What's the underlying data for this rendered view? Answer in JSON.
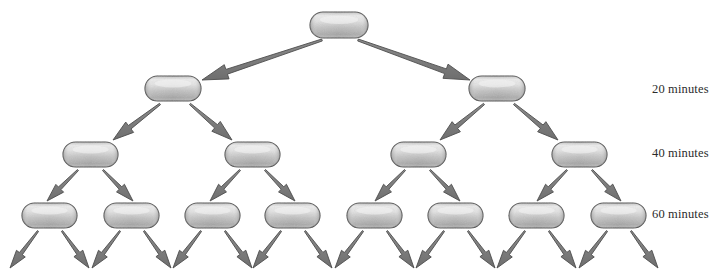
{
  "diagram": {
    "background_color": "#ffffff",
    "cell": {
      "name": "bacterium-capsule",
      "fill_light": "#e2e2e2",
      "fill_mid": "#bdbdbd",
      "fill_dark": "#9a9a9a",
      "outline_color": "#4a4a4a"
    },
    "arrow": {
      "name": "division-arrow",
      "fill_color": "#808080",
      "outline_color": "#4d4d4d"
    },
    "rows": [
      {
        "index": 0,
        "label": "",
        "cell_count": 1,
        "cells": [
          {
            "name": "cell-r0-c0",
            "x": 310,
            "y": 12,
            "w": 58,
            "h": 26
          }
        ]
      },
      {
        "index": 1,
        "label": "20 minutes",
        "cell_count": 2,
        "cells": [
          {
            "name": "cell-r1-c0",
            "x": 145,
            "y": 76,
            "w": 56,
            "h": 25
          },
          {
            "name": "cell-r1-c1",
            "x": 469,
            "y": 76,
            "w": 56,
            "h": 25
          }
        ]
      },
      {
        "index": 2,
        "label": "40 minutes",
        "cell_count": 4,
        "cells": [
          {
            "name": "cell-r2-c0",
            "x": 63,
            "y": 142,
            "w": 55,
            "h": 25
          },
          {
            "name": "cell-r2-c1",
            "x": 225,
            "y": 142,
            "w": 55,
            "h": 25
          },
          {
            "name": "cell-r2-c2",
            "x": 391,
            "y": 142,
            "w": 55,
            "h": 25
          },
          {
            "name": "cell-r2-c3",
            "x": 552,
            "y": 142,
            "w": 55,
            "h": 25
          }
        ]
      },
      {
        "index": 3,
        "label": "60 minutes",
        "cell_count": 8,
        "cells": [
          {
            "name": "cell-r3-c0",
            "x": 22,
            "y": 203,
            "w": 55,
            "h": 25
          },
          {
            "name": "cell-r3-c1",
            "x": 104,
            "y": 203,
            "w": 55,
            "h": 25
          },
          {
            "name": "cell-r3-c2",
            "x": 185,
            "y": 203,
            "w": 55,
            "h": 25
          },
          {
            "name": "cell-r3-c3",
            "x": 265,
            "y": 203,
            "w": 55,
            "h": 25
          },
          {
            "name": "cell-r3-c4",
            "x": 347,
            "y": 203,
            "w": 55,
            "h": 25
          },
          {
            "name": "cell-r3-c5",
            "x": 428,
            "y": 203,
            "w": 55,
            "h": 25
          },
          {
            "name": "cell-r3-c6",
            "x": 509,
            "y": 203,
            "w": 55,
            "h": 25
          },
          {
            "name": "cell-r3-c7",
            "x": 591,
            "y": 203,
            "w": 55,
            "h": 25
          }
        ]
      }
    ],
    "labels": {
      "t20": "20 minutes",
      "t40": "40 minutes",
      "t60": "60 minutes"
    },
    "arrows": [
      {
        "name": "arrow-r0-to-r1-left",
        "x1": 322,
        "y1": 40,
        "x2": 202,
        "y2": 80,
        "tail_w": 2.0,
        "head_w": 15,
        "head_len": 26
      },
      {
        "name": "arrow-r0-to-r1-right",
        "x1": 358,
        "y1": 40,
        "x2": 470,
        "y2": 80,
        "tail_w": 2.0,
        "head_w": 15,
        "head_len": 26
      },
      {
        "name": "arrow-r1-to-r2-l-left",
        "x1": 160,
        "y1": 104,
        "x2": 113,
        "y2": 140,
        "tail_w": 1.6,
        "head_w": 13,
        "head_len": 21
      },
      {
        "name": "arrow-r1-to-r2-l-right",
        "x1": 190,
        "y1": 104,
        "x2": 232,
        "y2": 140,
        "tail_w": 1.6,
        "head_w": 13,
        "head_len": 21
      },
      {
        "name": "arrow-r1-to-r2-r-left",
        "x1": 484,
        "y1": 104,
        "x2": 440,
        "y2": 140,
        "tail_w": 1.6,
        "head_w": 13,
        "head_len": 21
      },
      {
        "name": "arrow-r1-to-r2-r-right",
        "x1": 514,
        "y1": 104,
        "x2": 558,
        "y2": 140,
        "tail_w": 1.6,
        "head_w": 13,
        "head_len": 21
      },
      {
        "name": "arrow-r2-c0-left",
        "x1": 78,
        "y1": 170,
        "x2": 47,
        "y2": 201,
        "tail_w": 1.4,
        "head_w": 11,
        "head_len": 18
      },
      {
        "name": "arrow-r2-c0-right",
        "x1": 103,
        "y1": 170,
        "x2": 133,
        "y2": 201,
        "tail_w": 1.4,
        "head_w": 11,
        "head_len": 18
      },
      {
        "name": "arrow-r2-c1-left",
        "x1": 240,
        "y1": 170,
        "x2": 210,
        "y2": 201,
        "tail_w": 1.4,
        "head_w": 11,
        "head_len": 18
      },
      {
        "name": "arrow-r2-c1-right",
        "x1": 265,
        "y1": 170,
        "x2": 295,
        "y2": 201,
        "tail_w": 1.4,
        "head_w": 11,
        "head_len": 18
      },
      {
        "name": "arrow-r2-c2-left",
        "x1": 405,
        "y1": 170,
        "x2": 375,
        "y2": 201,
        "tail_w": 1.4,
        "head_w": 11,
        "head_len": 18
      },
      {
        "name": "arrow-r2-c2-right",
        "x1": 430,
        "y1": 170,
        "x2": 460,
        "y2": 201,
        "tail_w": 1.4,
        "head_w": 11,
        "head_len": 18
      },
      {
        "name": "arrow-r2-c3-left",
        "x1": 567,
        "y1": 170,
        "x2": 537,
        "y2": 201,
        "tail_w": 1.4,
        "head_w": 11,
        "head_len": 18
      },
      {
        "name": "arrow-r2-c3-right",
        "x1": 592,
        "y1": 170,
        "x2": 621,
        "y2": 201,
        "tail_w": 1.4,
        "head_w": 11,
        "head_len": 18
      },
      {
        "name": "arrow-r3-c0-left",
        "x1": 38,
        "y1": 231,
        "x2": 10,
        "y2": 268,
        "tail_w": 1.4,
        "head_w": 11,
        "head_len": 18
      },
      {
        "name": "arrow-r3-c0-right",
        "x1": 62,
        "y1": 231,
        "x2": 89,
        "y2": 268,
        "tail_w": 1.4,
        "head_w": 11,
        "head_len": 18
      },
      {
        "name": "arrow-r3-c1-left",
        "x1": 120,
        "y1": 231,
        "x2": 92,
        "y2": 268,
        "tail_w": 1.4,
        "head_w": 11,
        "head_len": 18
      },
      {
        "name": "arrow-r3-c1-right",
        "x1": 144,
        "y1": 231,
        "x2": 171,
        "y2": 268,
        "tail_w": 1.4,
        "head_w": 11,
        "head_len": 18
      },
      {
        "name": "arrow-r3-c2-left",
        "x1": 201,
        "y1": 231,
        "x2": 173,
        "y2": 268,
        "tail_w": 1.4,
        "head_w": 11,
        "head_len": 18
      },
      {
        "name": "arrow-r3-c2-right",
        "x1": 225,
        "y1": 231,
        "x2": 252,
        "y2": 268,
        "tail_w": 1.4,
        "head_w": 11,
        "head_len": 18
      },
      {
        "name": "arrow-r3-c3-left",
        "x1": 281,
        "y1": 231,
        "x2": 253,
        "y2": 268,
        "tail_w": 1.4,
        "head_w": 11,
        "head_len": 18
      },
      {
        "name": "arrow-r3-c3-right",
        "x1": 305,
        "y1": 231,
        "x2": 332,
        "y2": 268,
        "tail_w": 1.4,
        "head_w": 11,
        "head_len": 18
      },
      {
        "name": "arrow-r3-c4-left",
        "x1": 363,
        "y1": 231,
        "x2": 335,
        "y2": 268,
        "tail_w": 1.4,
        "head_w": 11,
        "head_len": 18
      },
      {
        "name": "arrow-r3-c4-right",
        "x1": 387,
        "y1": 231,
        "x2": 414,
        "y2": 268,
        "tail_w": 1.4,
        "head_w": 11,
        "head_len": 18
      },
      {
        "name": "arrow-r3-c5-left",
        "x1": 444,
        "y1": 231,
        "x2": 416,
        "y2": 268,
        "tail_w": 1.4,
        "head_w": 11,
        "head_len": 18
      },
      {
        "name": "arrow-r3-c5-right",
        "x1": 468,
        "y1": 231,
        "x2": 495,
        "y2": 268,
        "tail_w": 1.4,
        "head_w": 11,
        "head_len": 18
      },
      {
        "name": "arrow-r3-c6-left",
        "x1": 525,
        "y1": 231,
        "x2": 497,
        "y2": 268,
        "tail_w": 1.4,
        "head_w": 11,
        "head_len": 18
      },
      {
        "name": "arrow-r3-c6-right",
        "x1": 549,
        "y1": 231,
        "x2": 576,
        "y2": 268,
        "tail_w": 1.4,
        "head_w": 11,
        "head_len": 18
      },
      {
        "name": "arrow-r3-c7-left",
        "x1": 607,
        "y1": 231,
        "x2": 579,
        "y2": 268,
        "tail_w": 1.4,
        "head_w": 11,
        "head_len": 18
      },
      {
        "name": "arrow-r3-c7-right",
        "x1": 631,
        "y1": 231,
        "x2": 658,
        "y2": 268,
        "tail_w": 1.4,
        "head_w": 11,
        "head_len": 18
      }
    ]
  }
}
